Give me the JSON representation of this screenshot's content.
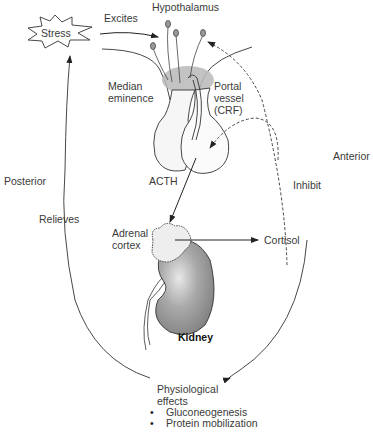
{
  "labels": {
    "stress": "Stress",
    "excites": "Excites",
    "hypothalamus": "Hypothalamus",
    "median_eminence_line1": "Median",
    "median_eminence_line2": "eminence",
    "portal_vessel_line1": "Portal",
    "portal_vessel_line2": "vessel",
    "portal_vessel_line3": "(CRF)",
    "anterior": "Anterior",
    "posterior": "Posterior",
    "acth": "ACTH",
    "inhibit": "Inhibit",
    "relieves": "Relieves",
    "adrenal_cortex_line1": "Adrenal",
    "adrenal_cortex_line2": "cortex",
    "cortisol": "Cortisol",
    "kidney": "Kidney",
    "physiological_effects_line1": "Physiological",
    "physiological_effects_line2": "effects"
  },
  "effects_list": [
    "Gluconeogenesis",
    "Protein mobilization"
  ],
  "colors": {
    "line": "#222222",
    "gland_fill": "#f4f4f4",
    "kidney_fill": "#9a9a9a",
    "median_eminence_fill": "#b5b5b5"
  }
}
